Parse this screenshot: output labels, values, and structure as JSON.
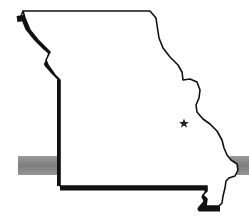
{
  "map": {
    "subject": "Missouri state outline",
    "marker": {
      "type": "star",
      "label": "location marker",
      "x": 184,
      "y": 123
    },
    "band": {
      "description": "horizontal gray band crossing behind state",
      "color": "#8a8a8a"
    },
    "colors": {
      "outline": "#111111",
      "fill": "#ffffff",
      "shadow": "#111111",
      "band": "#8a8a8a",
      "star": "#222222"
    }
  }
}
